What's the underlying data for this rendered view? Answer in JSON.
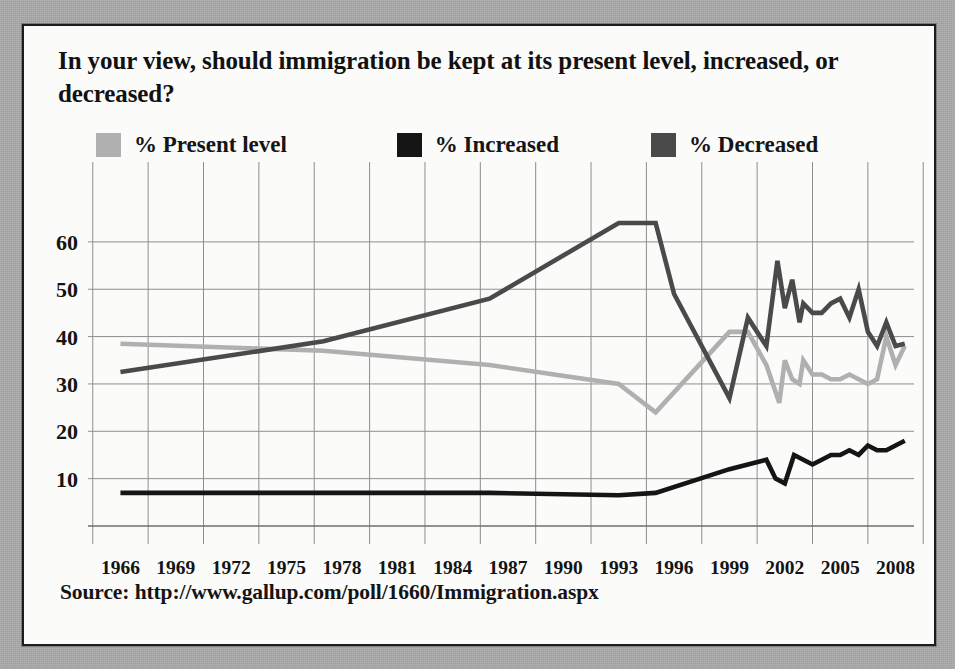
{
  "panel": {
    "title": "In your view, should immigration be kept at its present level, increased, or decreased?",
    "source": "Source: http://www.gallup.com/poll/1660/Immigration.aspx"
  },
  "colors": {
    "present_level": "#b0b0b0",
    "increased": "#151515",
    "decreased": "#4a4a4a",
    "grid": "#8e8e8e",
    "panel_background": "#fbfbfa",
    "page_background": "#a9a9a9",
    "border": "#1c1c1c",
    "text": "#141414"
  },
  "chart_data": {
    "type": "line",
    "title": "In your view, should immigration be kept at its present level, increased, or decreased?",
    "xlabel": "",
    "ylabel": "",
    "xlim": [
      1965,
      2009
    ],
    "ylim": [
      0,
      68
    ],
    "grid": true,
    "legend_position": "top",
    "y_ticks": [
      10,
      20,
      30,
      40,
      50,
      60
    ],
    "x_ticks": [
      1966,
      1969,
      1972,
      1975,
      1978,
      1981,
      1984,
      1987,
      1990,
      1993,
      1996,
      1999,
      2002,
      2005,
      2008
    ],
    "series": [
      {
        "name": "% Present level",
        "color": "#b0b0b0",
        "x": [
          1966,
          1977,
          1986,
          1993,
          1995,
          1999,
          2000,
          2001,
          2001.7,
          2002,
          2002.4,
          2002.8,
          2003,
          2003.5,
          2004,
          2004.5,
          2005,
          2005.5,
          2006,
          2006.5,
          2007,
          2007.5,
          2008,
          2008.5
        ],
        "values": [
          38.5,
          37,
          34,
          30,
          24,
          41,
          41,
          34,
          26,
          35,
          31,
          30,
          35,
          32,
          32,
          31,
          31,
          32,
          31,
          30,
          31,
          40,
          34,
          38
        ]
      },
      {
        "name": "% Increased",
        "color": "#151515",
        "x": [
          1966,
          1977,
          1986,
          1993,
          1995,
          1999,
          2000,
          2001,
          2001.5,
          2002,
          2002.5,
          2003,
          2003.5,
          2004,
          2004.5,
          2005,
          2005.5,
          2006,
          2006.5,
          2007,
          2007.5,
          2008,
          2008.5
        ],
        "values": [
          7,
          7,
          7,
          6.5,
          7,
          12,
          13,
          14,
          10,
          9,
          15,
          14,
          13,
          14,
          15,
          15,
          16,
          15,
          17,
          16,
          16,
          17,
          18
        ]
      },
      {
        "name": "% Decreased",
        "color": "#4a4a4a",
        "x": [
          1966,
          1977,
          1986,
          1993,
          1995,
          1996,
          1999,
          2000,
          2001,
          2001.6,
          2002,
          2002.4,
          2002.8,
          2003,
          2003.5,
          2004,
          2004.5,
          2005,
          2005.5,
          2006,
          2006.5,
          2007,
          2007.5,
          2008,
          2008.5
        ],
        "values": [
          32.5,
          39,
          48,
          64,
          64,
          49,
          27,
          44,
          38,
          56,
          46,
          52,
          43,
          47,
          45,
          45,
          47,
          48,
          44,
          50,
          41,
          38,
          43,
          38,
          38.5
        ]
      }
    ]
  },
  "legend": {
    "items": [
      {
        "label": "% Present level",
        "color": "#b0b0b0"
      },
      {
        "label": "% Increased",
        "color": "#151515"
      },
      {
        "label": "% Decreased",
        "color": "#4a4a4a"
      }
    ]
  }
}
